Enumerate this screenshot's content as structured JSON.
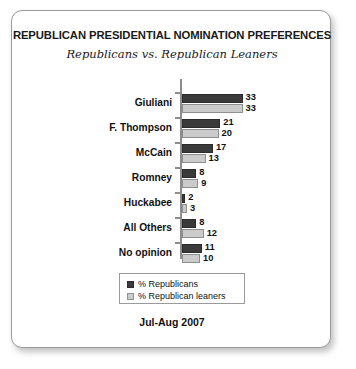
{
  "chart_data": {
    "type": "bar",
    "orientation": "horizontal",
    "title": "REPUBLICAN PRESIDENTIAL NOMINATION PREFERENCES",
    "subtitle": "Republicans vs. Republican Leaners",
    "footer": "Jul-Aug 2007",
    "xlabel": "",
    "ylabel": "",
    "grid": false,
    "legend_position": "bottom",
    "xlim": [
      0,
      35
    ],
    "categories": [
      "Giuliani",
      "F. Thompson",
      "McCain",
      "Romney",
      "Huckabee",
      "All Others",
      "No opinion"
    ],
    "series": [
      {
        "name": "% Republicans",
        "color": "#3a3a3a",
        "values": [
          33,
          21,
          17,
          8,
          2,
          8,
          11
        ]
      },
      {
        "name": "% Republican leaners",
        "color": "#cbcbcb",
        "values": [
          33,
          20,
          13,
          9,
          3,
          12,
          10
        ]
      }
    ]
  },
  "legend": {
    "items": [
      {
        "label": "% Republicans"
      },
      {
        "label": "% Republican leaners"
      }
    ]
  }
}
